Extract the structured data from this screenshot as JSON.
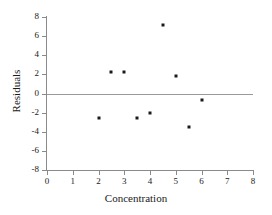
{
  "chart_data": {
    "type": "scatter",
    "title": "",
    "xlabel": "Concentration",
    "ylabel": "Residuals",
    "xlim": [
      0,
      8
    ],
    "ylim": [
      -8,
      8
    ],
    "xticks": [
      0,
      1,
      2,
      3,
      4,
      5,
      6,
      7,
      8
    ],
    "yticks": [
      8,
      6,
      4,
      2,
      0,
      -2,
      -4,
      -6,
      -8
    ],
    "xtick_labels": [
      "0",
      "1",
      "2",
      "3",
      "4",
      "5",
      "6",
      "7",
      "8"
    ],
    "ytick_labels": [
      "8",
      "6",
      "4",
      "2",
      "0",
      "-2",
      "-4",
      "-6",
      "-8"
    ],
    "grid": false,
    "legend": null,
    "reference_lines": [
      {
        "axis": "y",
        "value": 0,
        "color": "#9a9a9a"
      }
    ],
    "marker": {
      "shape": "square",
      "color": "#1a1a1a",
      "size": 3
    },
    "points": [
      {
        "x": 2.0,
        "y": -2.6
      },
      {
        "x": 2.5,
        "y": 2.2
      },
      {
        "x": 3.0,
        "y": 2.2
      },
      {
        "x": 3.5,
        "y": -2.6
      },
      {
        "x": 4.0,
        "y": -2.0
      },
      {
        "x": 4.5,
        "y": 7.2
      },
      {
        "x": 5.0,
        "y": 1.8
      },
      {
        "x": 5.5,
        "y": -3.5
      },
      {
        "x": 6.0,
        "y": -0.7
      }
    ]
  },
  "axes": {
    "line_color": "#8a8a8a"
  }
}
